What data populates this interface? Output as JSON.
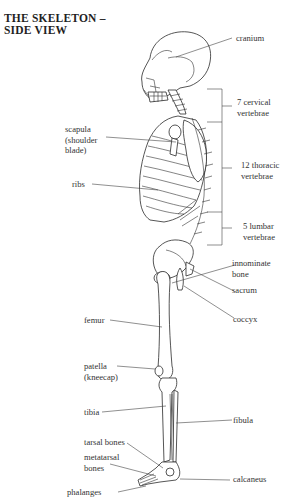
{
  "title": {
    "line1": "THE SKELETON –",
    "line2": "SIDE VIEW"
  },
  "labels": {
    "cranium": "cranium",
    "scapula": [
      "scapula",
      "(shoulder",
      "blade)"
    ],
    "ribs": "ribs",
    "cervical": [
      "7 cervical",
      "vertebrae"
    ],
    "thoracic": [
      "12 thoracic",
      "vertebrae"
    ],
    "lumbar": [
      "5 lumbar",
      "vertebrae"
    ],
    "innominate": [
      "innominate",
      "bone"
    ],
    "sacrum": "sacrum",
    "coccyx": "coccyx",
    "femur": "femur",
    "patella": [
      "patella",
      "(kneecap)"
    ],
    "tibia": "tibia",
    "fibula": "fibula",
    "tarsal": "tarsal bones",
    "metatarsal": [
      "metatarsal",
      "bones"
    ],
    "calcaneus": "calcaneus",
    "phalanges": "phalanges"
  },
  "colors": {
    "line": "#2b2b2b",
    "text": "#333333",
    "background": "#ffffff"
  }
}
